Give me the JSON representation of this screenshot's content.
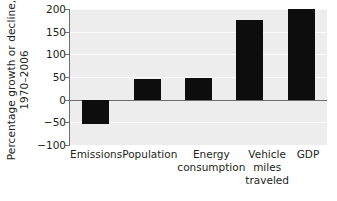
{
  "chart_data": {
    "type": "bar",
    "title": "",
    "subtitle": "",
    "xlabel": "",
    "ylabel": "Percentage growth or decline, 1970–2006",
    "ylabel_lines": [
      "Percentage growth or decline,",
      "1970–2006"
    ],
    "categories": [
      "Emissions",
      "Population",
      "Energy consumption",
      "Vehicle miles traveled",
      "GDP"
    ],
    "category_label_lines": [
      [
        "Emissions"
      ],
      [
        "Population"
      ],
      [
        "Energy",
        "consumption"
      ],
      [
        "Vehicle",
        "miles",
        "traveled"
      ],
      [
        "GDP"
      ]
    ],
    "values": [
      -53,
      45,
      47,
      175,
      201
    ],
    "ylim": [
      -100,
      200
    ],
    "yticks": [
      200,
      150,
      100,
      50,
      0,
      -50,
      -100
    ],
    "ytick_labels": [
      "200",
      "150",
      "100",
      "50",
      "0",
      "−50",
      "−100"
    ],
    "grid": true,
    "legend": false,
    "legend_position": "none",
    "bar_color": "#0d0d0d",
    "plot_background": "#ededed",
    "gridline_color": "#fbfbfb",
    "axis_color": "#6d6e71",
    "text_color": "#231f20"
  }
}
